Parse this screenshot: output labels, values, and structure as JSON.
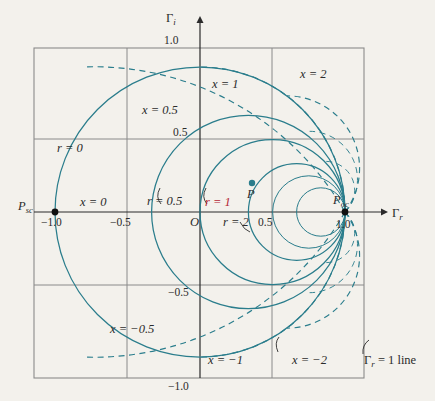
{
  "figure": {
    "type": "smith-chart",
    "background_color": "#f3f1ec",
    "curve_color": "#2a7d8c",
    "grid_color": "#8a8a8a",
    "label_color": "#2b2b2b",
    "accent_color": "#b32435",
    "top_faint_text": "",
    "axes": {
      "x_label": "Γ",
      "x_label_sub": "r",
      "y_label": "Γ",
      "y_label_sub": "i",
      "origin_label": "O",
      "x_ticks": [
        "−1.0",
        "−0.5",
        "0.5",
        "1.0"
      ],
      "y_ticks": [
        "1.0",
        "0.5",
        "−0.5",
        "−1.0"
      ],
      "xlim": [
        -1.3,
        1.3
      ],
      "ylim": [
        -1.3,
        1.3
      ]
    },
    "points": [
      {
        "name": "P_sc",
        "label": "P",
        "sub": "sc",
        "coords": [
          -1.0,
          0.0
        ]
      },
      {
        "name": "P_oc",
        "label": "P",
        "sub": "oc",
        "coords": [
          1.0,
          0.0
        ]
      },
      {
        "name": "P",
        "label": "P",
        "sub": "",
        "coords": [
          0.36,
          0.2
        ]
      }
    ],
    "resistance_circles": [
      {
        "label": "r = 0",
        "r": 0,
        "color": "#2a7d8c"
      },
      {
        "label": "r = 0.5",
        "r": 0.5,
        "color": "#2a7d8c"
      },
      {
        "label": "r = 1",
        "r": 1,
        "color": "#b32435"
      },
      {
        "label": "r = 2",
        "r": 2,
        "color": "#2a7d8c"
      }
    ],
    "reactance_arcs": [
      {
        "label": "x = 0",
        "x": 0
      },
      {
        "label": "x = 0.5",
        "x": 0.5
      },
      {
        "label": "x = 1",
        "x": 1
      },
      {
        "label": "x = 2",
        "x": 2
      },
      {
        "label": "x = −0.5",
        "x": -0.5
      },
      {
        "label": "x = −1",
        "x": -1
      },
      {
        "label": "x = −2",
        "x": -2
      }
    ],
    "annotation": {
      "text": " = 1 line",
      "symbol": "Γ",
      "symbol_sub": "r"
    }
  }
}
